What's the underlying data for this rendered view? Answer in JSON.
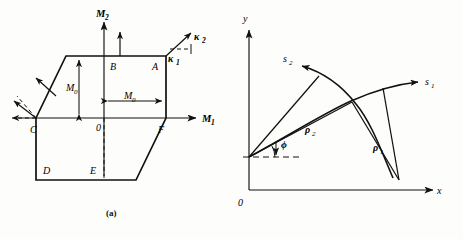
{
  "figure": {
    "panels": [
      {
        "id": "a",
        "caption": "(a)",
        "type": "yield-locus-hexagon",
        "axes": {
          "x_label": "M",
          "x_label_sub": "1",
          "y_label": "M",
          "y_label_sub": "2",
          "origin_label": "0"
        },
        "vertices": [
          {
            "name": "A",
            "label": "A"
          },
          {
            "name": "B",
            "label": "B"
          },
          {
            "name": "C",
            "label": "C"
          },
          {
            "name": "D",
            "label": "D"
          },
          {
            "name": "E",
            "label": "E"
          },
          {
            "name": "F",
            "label": "F"
          }
        ],
        "dimensions": [
          {
            "label": "M",
            "sub": "0",
            "orientation": "vertical"
          },
          {
            "label": "M",
            "sub": "0",
            "orientation": "horizontal"
          }
        ],
        "vectors": [
          {
            "label": "κ",
            "sub": "2",
            "kind": "curvature-rate"
          },
          {
            "label": "κ",
            "sub": "1",
            "kind": "curvature-rate"
          }
        ]
      },
      {
        "id": "b",
        "caption": "(b)",
        "type": "slip-line-field",
        "axes": {
          "x_label": "x",
          "y_label": "y",
          "origin_label": "0"
        },
        "curves": [
          {
            "label": "s",
            "sub": "1"
          },
          {
            "label": "s",
            "sub": "2"
          }
        ],
        "radii": [
          {
            "label": "ρ",
            "sub": "1"
          },
          {
            "label": "ρ",
            "sub": "2"
          }
        ],
        "angle": {
          "label": "ϕ"
        }
      }
    ],
    "colors": {
      "ink": "#111111",
      "paper": "#fdfdfb"
    }
  }
}
